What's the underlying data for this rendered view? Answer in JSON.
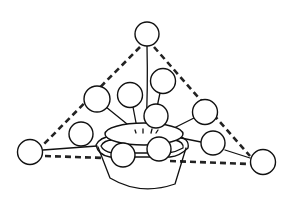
{
  "figure": {
    "outline_style": "dashed triangle",
    "ink_color": "#111111",
    "background_color": "#ffffff",
    "bloom_count": 12,
    "elements": {
      "bowl": "container",
      "blooms": "circular flower heads on stems",
      "guide": "dashed triangular composition guide"
    }
  }
}
